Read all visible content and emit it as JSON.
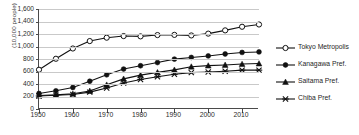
{
  "chart_data": {
    "type": "line",
    "title": "",
    "xlabel": "",
    "ylabel": "(10,000 people)",
    "xlim": [
      1950,
      2015
    ],
    "ylim": [
      0,
      1600
    ],
    "grid": true,
    "legend_position": "right",
    "x": [
      1950,
      1955,
      1960,
      1965,
      1970,
      1975,
      1980,
      1985,
      1990,
      1995,
      2000,
      2005,
      2010,
      2015
    ],
    "xticks": [
      "1950",
      "1960",
      "1970",
      "1980",
      "1990",
      "2000",
      "2010"
    ],
    "xtick_values": [
      1950,
      1960,
      1970,
      1980,
      1990,
      2000,
      2010
    ],
    "yticks": [
      "0",
      "200",
      "400",
      "600",
      "800",
      "1,000",
      "1,200",
      "1,400",
      "1,600"
    ],
    "ytick_values": [
      0,
      200,
      400,
      600,
      800,
      1000,
      1200,
      1400,
      1600
    ],
    "series": [
      {
        "name": "Tokyo Metropolis",
        "marker": "open-circle",
        "values": [
          628,
          804,
          968,
          1087,
          1141,
          1167,
          1162,
          1183,
          1186,
          1177,
          1206,
          1258,
          1316,
          1352
        ]
      },
      {
        "name": "Kanagawa Pref.",
        "marker": "filled-circle",
        "values": [
          249,
          291,
          344,
          444,
          547,
          639,
          692,
          743,
          798,
          825,
          849,
          880,
          905,
          913
        ]
      },
      {
        "name": "Saitama Pref.",
        "marker": "filled-triangle",
        "values": [
          215,
          226,
          243,
          289,
          387,
          482,
          542,
          586,
          626,
          677,
          694,
          705,
          719,
          727
        ]
      },
      {
        "name": "Chiba Pref.",
        "marker": "x-cross",
        "values": [
          209,
          219,
          231,
          270,
          337,
          415,
          473,
          515,
          555,
          582,
          593,
          605,
          622,
          622
        ]
      }
    ]
  }
}
